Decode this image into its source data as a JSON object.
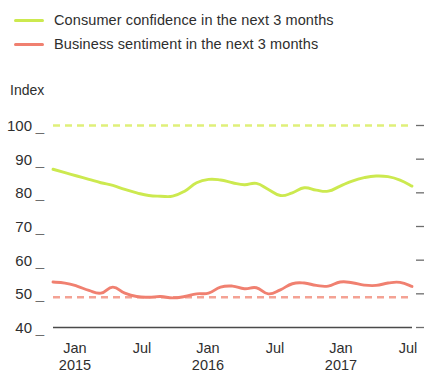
{
  "legend": {
    "position": "top-left",
    "items": [
      {
        "label": "Consumer confidence in the next 3 months",
        "color": "#cce94f",
        "swatch": "line"
      },
      {
        "label": "Business sentiment in the next 3 months",
        "color": "#f08070",
        "swatch": "line"
      }
    ]
  },
  "axes": {
    "y_title": "Index",
    "y_ticks": [
      "100",
      "90",
      "80",
      "70",
      "60",
      "50",
      "40"
    ],
    "x_ticks": [
      {
        "month": "Jan",
        "year": "2015"
      },
      {
        "month": "Jul",
        "year": ""
      },
      {
        "month": "Jan",
        "year": "2016"
      },
      {
        "month": "Jul",
        "year": ""
      },
      {
        "month": "Jan",
        "year": "2017"
      },
      {
        "month": "Jul",
        "year": ""
      }
    ]
  },
  "colors": {
    "consumer": "#cce94f",
    "business": "#f08070",
    "consumer_reference": "#dff07a",
    "business_reference": "#f4a294",
    "axis": "#4a4a4a",
    "tick": "#6d6d6d",
    "text": "#2e2e2e"
  },
  "chart_data": {
    "type": "line",
    "title": "",
    "xlabel": "",
    "ylabel": "Index",
    "ylim": [
      40,
      103
    ],
    "grid": false,
    "legend_position": "top-left",
    "categories": [
      "Jan 2015",
      "Feb 2015",
      "Mar 2015",
      "Apr 2015",
      "May 2015",
      "Jun 2015",
      "Jul 2015",
      "Aug 2015",
      "Sep 2015",
      "Oct 2015",
      "Nov 2015",
      "Dec 2015",
      "Jan 2016",
      "Feb 2016",
      "Mar 2016",
      "Apr 2016",
      "May 2016",
      "Jun 2016",
      "Jul 2016",
      "Aug 2016",
      "Sep 2016",
      "Oct 2016",
      "Nov 2016",
      "Dec 2016",
      "Jan 2017",
      "Feb 2017",
      "Mar 2017",
      "Apr 2017",
      "May 2017",
      "Jun 2017",
      "Jul 2017"
    ],
    "series": [
      {
        "name": "Consumer confidence in the next 3 months",
        "color": "#cce94f",
        "style": "solid",
        "values": [
          87.0,
          86.0,
          85.0,
          84.0,
          83.0,
          82.2,
          81.0,
          80.0,
          79.2,
          79.0,
          79.0,
          80.5,
          83.0,
          84.0,
          83.8,
          83.0,
          82.4,
          82.8,
          81.0,
          79.2,
          80.0,
          81.5,
          80.8,
          80.5,
          82.0,
          83.5,
          84.5,
          85.0,
          84.8,
          83.8,
          82.0
        ]
      },
      {
        "name": "Business sentiment in the next 3 months",
        "color": "#f08070",
        "style": "solid",
        "values": [
          53.5,
          53.2,
          52.3,
          51.0,
          50.2,
          52.0,
          50.2,
          49.2,
          49.0,
          49.2,
          48.8,
          49.2,
          50.0,
          50.2,
          52.0,
          52.3,
          51.5,
          51.8,
          50.0,
          51.2,
          53.0,
          53.2,
          52.5,
          52.3,
          53.5,
          53.3,
          52.6,
          52.5,
          53.2,
          53.4,
          52.2
        ]
      }
    ],
    "reference_lines": [
      {
        "name": "Consumer confidence reference",
        "value": 100,
        "color": "#dff07a",
        "style": "dashed"
      },
      {
        "name": "Business sentiment reference",
        "value": 49,
        "color": "#f4a294",
        "style": "dashed"
      }
    ]
  }
}
